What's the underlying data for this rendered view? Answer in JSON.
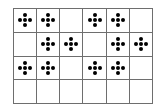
{
  "grid": {
    "rows": 4,
    "cols": 6,
    "symbol": "five-dot-diamond",
    "line_color": "#6e6e6e",
    "symbol_color": "#000000",
    "cells": [
      [
        1,
        1,
        0,
        1,
        1,
        0
      ],
      [
        0,
        1,
        1,
        0,
        1,
        1
      ],
      [
        1,
        1,
        0,
        1,
        1,
        0
      ],
      [
        0,
        0,
        0,
        0,
        0,
        0
      ]
    ]
  }
}
